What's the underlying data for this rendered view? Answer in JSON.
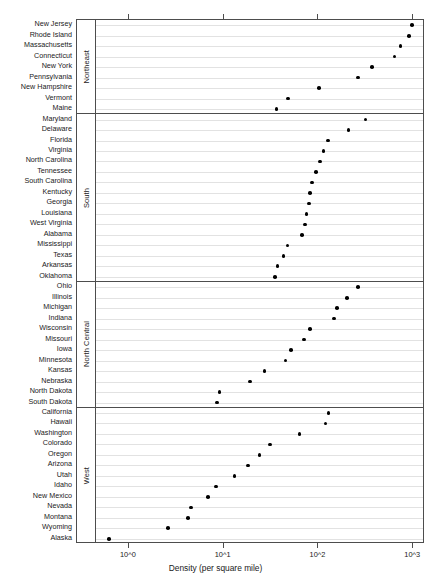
{
  "chart_data": {
    "type": "scatter",
    "subtype": "cleveland-dot-plot",
    "title": "",
    "xlabel": "Density (per square mile)",
    "ylabel": "",
    "xscale": "log10",
    "xlim": [
      0.45,
      1300
    ],
    "grid": true,
    "legend": null,
    "panel_variable": "Region",
    "xticks": [
      {
        "value": 1,
        "label": "10^0",
        "mantissa": "10",
        "exponent": "0"
      },
      {
        "value": 10,
        "label": "10^1",
        "mantissa": "10",
        "exponent": "1"
      },
      {
        "value": 100,
        "label": "10^2",
        "mantissa": "10",
        "exponent": "2"
      },
      {
        "value": 1000,
        "label": "10^3",
        "mantissa": "10",
        "exponent": "3"
      }
    ],
    "panels": [
      {
        "name": "Northeast",
        "categories": [
          "New Jersey",
          "Rhode Island",
          "Massachusetts",
          "Connecticut",
          "New York",
          "Pennsylvania",
          "New Hampshire",
          "Vermont",
          "Maine"
        ],
        "values": [
          975,
          905,
          737,
          634,
          370,
          260,
          102,
          48,
          36
        ]
      },
      {
        "name": "South",
        "categories": [
          "Maryland",
          "Delaware",
          "Florida",
          "Virginia",
          "North Carolina",
          "Tennessee",
          "South Carolina",
          "Kentucky",
          "Georgia",
          "Louisiana",
          "West Virginia",
          "Alabama",
          "Mississippi",
          "Texas",
          "Arkansas",
          "Oklahoma"
        ],
        "values": [
          315,
          208,
          126,
          113,
          104,
          94,
          86,
          81,
          79,
          75,
          72,
          67,
          47,
          43,
          37,
          35
        ]
      },
      {
        "name": "North Central",
        "categories": [
          "Ohio",
          "Illinois",
          "Michigan",
          "Indiana",
          "Wisconsin",
          "Missouri",
          "Iowa",
          "Minnesota",
          "Kansas",
          "Nebraska",
          "North Dakota",
          "South Dakota"
        ],
        "values": [
          260,
          200,
          158,
          145,
          82,
          70,
          51,
          45,
          27,
          19,
          9,
          8.5
        ]
      },
      {
        "name": "West",
        "categories": [
          "California",
          "Hawaii",
          "Washington",
          "Colorado",
          "Oregon",
          "Arizona",
          "Utah",
          "Idaho",
          "New Mexico",
          "Nevada",
          "Montana",
          "Wyoming",
          "Alaska"
        ],
        "values": [
          128,
          119,
          63,
          31,
          24,
          18,
          13,
          8.3,
          6.8,
          4.5,
          4.2,
          2.6,
          0.62
        ]
      }
    ]
  },
  "axis": {
    "x_title": "Density (per square mile)"
  },
  "strips": {
    "northeast": "Northeast",
    "south": "South",
    "north_central": "North Central",
    "west": "West"
  }
}
